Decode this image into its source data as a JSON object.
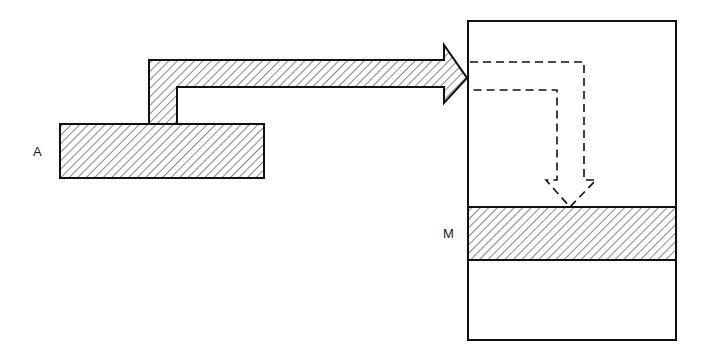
{
  "diagram": {
    "labels": {
      "a": "A",
      "m": "M"
    },
    "elements": {
      "source_block": "A",
      "target_region": "M",
      "container": "memory box",
      "transfer_arrow": "hatched arrow from A to container",
      "path_arrow": "dashed arrow descending to M"
    },
    "colors": {
      "stroke": "#111111",
      "background": "#ffffff"
    }
  }
}
